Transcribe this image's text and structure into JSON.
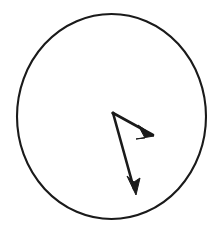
{
  "figure": {
    "kind": "geometry-diagram",
    "background_color": "#ffffff",
    "ink_color": "#1a1a1a",
    "canvas": {
      "width": 220,
      "height": 233
    },
    "circle": {
      "name": "circle-outline",
      "center_x": 111.5,
      "center_y": 116.5,
      "radius_x": 94.5,
      "radius_y": 102.5,
      "stroke_width": 2.1,
      "stroke_color": "#1a1a1a",
      "fill": "none"
    },
    "origin_point": {
      "name": "vector-origin",
      "x": 113,
      "y": 113
    },
    "vectors": [
      {
        "name": "vector-right-down",
        "label": "",
        "start_x": 113,
        "start_y": 113,
        "end_x": 153,
        "end_y": 135,
        "tip_x": 154,
        "tip_y": 136,
        "stroke_width": 2.6,
        "stroke_color": "#1a1a1a",
        "arrowhead": "solid-triangle",
        "arrowhead_points": "154,136 138,125 145,138 136,139",
        "angle_degrees": 28.8,
        "length_px": 45.6
      },
      {
        "name": "vector-down",
        "label": "",
        "start_x": 113,
        "start_y": 113,
        "end_x": 134,
        "end_y": 189,
        "tip_x": 136,
        "tip_y": 195,
        "stroke_width": 2.6,
        "stroke_color": "#1a1a1a",
        "arrowhead": "solid-triangle",
        "arrowhead_points": "136,195 127,176 134,182 140,178",
        "angle_degrees": 74.5,
        "length_px": 82.7
      }
    ],
    "annotations": []
  }
}
